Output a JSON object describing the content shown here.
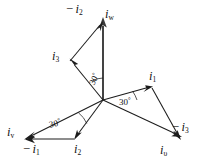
{
  "figure": {
    "background_color": "#ffffff",
    "line_color": "#1c1c1c",
    "axis_color": "#3a3a3a",
    "width": 207,
    "height": 168
  },
  "origin": {
    "x": 103,
    "y": 100
  },
  "labels": {
    "minus_i2": {
      "text_main": "i",
      "sign": "−",
      "sub": "2",
      "x": 68,
      "y": 6
    },
    "i_w": {
      "text_main": "i",
      "sub": "w",
      "x": 106,
      "y": 11
    },
    "i_3": {
      "text_main": "i",
      "sub": "3",
      "x": 54,
      "y": 53
    },
    "i_1": {
      "text_main": "i",
      "sub": "1",
      "x": 150,
      "y": 73
    },
    "minus_i3": {
      "text_main": "i",
      "sign": "−",
      "sub": "3",
      "x": 173,
      "y": 124
    },
    "i_u": {
      "text_main": "i",
      "sub": "υ",
      "x": 161,
      "y": 147
    },
    "i_v": {
      "text_main": "i",
      "sub": "v",
      "x": 8,
      "y": 129
    },
    "minus_i1": {
      "text_main": "i",
      "sign": "−",
      "sub": "1",
      "x": 24,
      "y": 146
    },
    "i_2": {
      "text_main": "i",
      "sub": "2",
      "x": 75,
      "y": 146
    }
  },
  "angles": [
    {
      "name": "angle-upper",
      "value": "30",
      "unit": "°",
      "x": 89,
      "y": 76,
      "rotation": -62
    },
    {
      "name": "angle-right",
      "value": "30",
      "unit": "°",
      "x": 120,
      "y": 100,
      "rotation": 0
    },
    {
      "name": "angle-lower-left",
      "value": "30",
      "unit": "°",
      "x": 49,
      "y": 121,
      "rotation": -13
    }
  ],
  "vectors": [
    {
      "name": "i_w",
      "label": "i_w",
      "from": "origin",
      "to": {
        "x": 103,
        "y": 22
      },
      "direction_deg": 90,
      "style": "thick-grey"
    },
    {
      "name": "i_1",
      "label": "i_1",
      "from": "origin",
      "to": {
        "x": 152,
        "y": 88
      },
      "direction_deg": 30,
      "style": "thin"
    },
    {
      "name": "i_3",
      "label": "i_3",
      "from": "origin",
      "to": {
        "x": 70,
        "y": 61
      },
      "direction_deg": 120,
      "style": "thin"
    },
    {
      "name": "i_2",
      "label": "i_2",
      "from": "origin",
      "to": {
        "x": 74,
        "y": 139
      },
      "direction_deg": 210,
      "style": "thin"
    },
    {
      "name": "i_u",
      "label": "i_υ",
      "from": "origin",
      "to": {
        "x": 181,
        "y": 139
      },
      "direction_deg": -30,
      "style": "thin"
    },
    {
      "name": "i_v",
      "label": "i_v",
      "from": "origin",
      "to": {
        "x": 25,
        "y": 139
      },
      "direction_deg": 210,
      "style": "thin"
    },
    {
      "name": "minus_i2",
      "label": "-i_2",
      "from": {
        "x": 70,
        "y": 61
      },
      "to": {
        "x": 99,
        "y": 21
      },
      "direction_deg": 30,
      "style": "thin"
    },
    {
      "name": "minus_i3",
      "label": "-i_3",
      "from": {
        "x": 152,
        "y": 88
      },
      "to": {
        "x": 180,
        "y": 138
      },
      "direction_deg": -60,
      "style": "thin"
    },
    {
      "name": "minus_i1",
      "label": "-i_1",
      "from": {
        "x": 74,
        "y": 139
      },
      "to": {
        "x": 26,
        "y": 139
      },
      "direction_deg": 180,
      "style": "thin"
    }
  ],
  "relations": [
    "i_w = i_3 + (-i_2)",
    "i_υ = i_1 + (-i_3)",
    "i_v = i_2 + (-i_1)"
  ]
}
